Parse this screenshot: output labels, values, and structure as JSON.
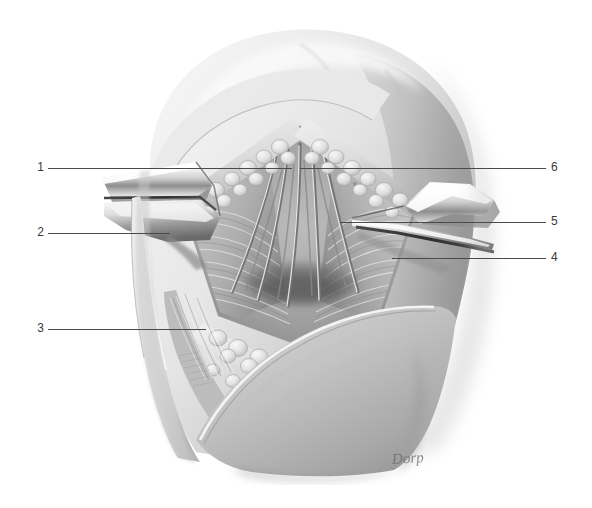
{
  "figure": {
    "medium": "grayscale anatomical illustration",
    "background_color": "#ffffff",
    "signature": "Dorp",
    "line_color": "#4a4a4a",
    "label_color": "#3a3a3a",
    "tones": {
      "skin_light": "#ececec",
      "skin_mid": "#d4d4d4",
      "skin_shadow": "#a9a9a9",
      "deep_shadow": "#6f6f6f",
      "metal_highlight": "#fbfbfb",
      "metal_mid": "#c9c9c9",
      "metal_dark": "#5c5c5c",
      "fat_light": "#e3e3e3",
      "fat_outline": "#9a9a9a",
      "muscle_mid": "#bdbdbd"
    }
  },
  "labels": {
    "left": [
      {
        "id": "label-1",
        "text": "1",
        "num_x": 38,
        "num_y": 161,
        "line_x": 48,
        "line_y": 168,
        "line_w": 244
      },
      {
        "id": "label-2",
        "text": "2",
        "num_x": 38,
        "num_y": 226,
        "line_x": 48,
        "line_y": 233,
        "line_w": 122
      },
      {
        "id": "label-3",
        "text": "3",
        "num_x": 38,
        "num_y": 322,
        "line_x": 48,
        "line_y": 329,
        "line_w": 158
      }
    ],
    "right": [
      {
        "id": "label-6",
        "text": "6",
        "num_x": 551,
        "num_y": 161,
        "line_x": 300,
        "line_y": 168,
        "line_w": 246
      },
      {
        "id": "label-5",
        "text": "5",
        "num_x": 551,
        "num_y": 215,
        "line_x": 340,
        "line_y": 222,
        "line_w": 206
      },
      {
        "id": "label-4",
        "text": "4",
        "num_x": 551,
        "num_y": 251,
        "line_x": 392,
        "line_y": 258,
        "line_w": 154
      }
    ]
  },
  "structures": {
    "head": "rounded cranial / occipital contour, upper half of frame",
    "skin_flap_lower": "large reflected skin flap across lower right",
    "retractor_left": "metal retractor blade, upper left of wound",
    "retractor_right": "metal retractor blade, upper right of wound",
    "fat_bands": "lobulated subcutaneous fat along both wound margins",
    "wound_field": "triangular deep dissection field with muscle fibers and converging nerve/vessel strands"
  },
  "icons": {
    "none": ""
  }
}
